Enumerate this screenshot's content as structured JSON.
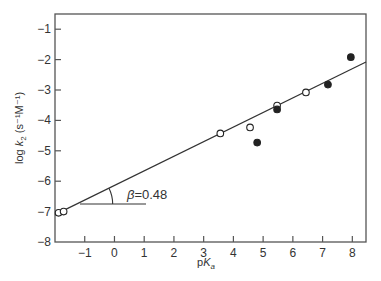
{
  "chart_data": {
    "type": "scatter",
    "title": "",
    "xlabel": "pKa",
    "xlabel_parts": {
      "p": "p",
      "K": "K",
      "sub": "a"
    },
    "ylabel": "log k2 (s^-1 M^-1)",
    "ylabel_parts": {
      "prefix": "log ",
      "k": "k",
      "sub": "2",
      "units": " (s⁻¹M⁻¹)"
    },
    "xlim": [
      -2,
      8.46
    ],
    "ylim": [
      -8,
      -0.5
    ],
    "x_ticks": [
      -1,
      0,
      1,
      2,
      3,
      4,
      5,
      6,
      7,
      8
    ],
    "x_tick_labels": [
      "−1",
      "0",
      "1",
      "2",
      "3",
      "4",
      "5",
      "6",
      "7",
      "8"
    ],
    "y_ticks": [
      -1,
      -2,
      -3,
      -4,
      -5,
      -6,
      -7,
      -8
    ],
    "y_tick_labels": [
      "−1",
      "−2",
      "−3",
      "−4",
      "−5",
      "−6",
      "−7",
      "−8"
    ],
    "grid": false,
    "legend": null,
    "series": [
      {
        "name": "open circles",
        "marker": "open-circle",
        "points": [
          {
            "x": -1.88,
            "y": -7.04
          },
          {
            "x": -1.71,
            "y": -7.0
          },
          {
            "x": 3.56,
            "y": -4.43
          },
          {
            "x": 4.56,
            "y": -4.23
          },
          {
            "x": 5.47,
            "y": -3.51
          },
          {
            "x": 6.44,
            "y": -3.08
          }
        ]
      },
      {
        "name": "filled circles",
        "marker": "filled-circle",
        "points": [
          {
            "x": 4.8,
            "y": -4.73
          },
          {
            "x": 5.47,
            "y": -3.64
          },
          {
            "x": 7.18,
            "y": -2.82
          },
          {
            "x": 7.95,
            "y": -1.92
          }
        ]
      }
    ],
    "fit_line": {
      "x0": -2,
      "y0": -7.1,
      "x1": 8.46,
      "y1": -2.08,
      "slope": 0.48
    },
    "annotations": [
      {
        "text": "β = 0.48",
        "symbol": "β",
        "value": "=0.48",
        "x": 0.45,
        "y": -6.3
      }
    ],
    "colors": {
      "axis": "#555555",
      "line": "#333333",
      "marker": "#222222",
      "background": "#ffffff"
    }
  }
}
